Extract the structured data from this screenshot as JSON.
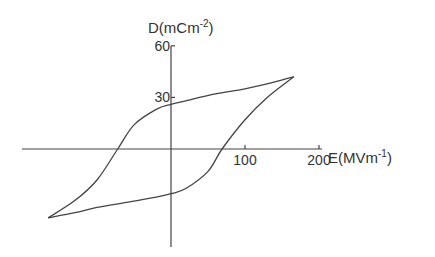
{
  "chart_data": {
    "type": "line",
    "title": "",
    "xlabel": "E(MVm-1)",
    "ylabel": "D(mCm-2)",
    "xlabel_parts": {
      "base": "E(MVm",
      "sup": "-1",
      "close": ")"
    },
    "ylabel_parts": {
      "base": "D(mCm",
      "sup": "-2",
      "close": ")"
    },
    "x_ticks": [
      100,
      200
    ],
    "x_tick_labels": [
      "100",
      "200"
    ],
    "y_ticks": [
      30,
      60
    ],
    "y_tick_labels": [
      "30",
      "60"
    ],
    "xlim": [
      -200,
      200
    ],
    "ylim": [
      -60,
      60
    ],
    "grid": false,
    "legend": null,
    "series": [
      {
        "name": "upper branch (decreasing E)",
        "x": [
          166,
          140,
          100,
          60,
          20,
          0,
          -20,
          -50,
          -72,
          -100,
          -130,
          -166
        ],
        "y": [
          42,
          39,
          35,
          32,
          28,
          26,
          23,
          14,
          0,
          -18,
          -30,
          -40
        ]
      },
      {
        "name": "lower branch (increasing E)",
        "x": [
          -166,
          -130,
          -100,
          -60,
          -20,
          0,
          20,
          50,
          69,
          100,
          130,
          166
        ],
        "y": [
          -40,
          -37,
          -34,
          -31,
          -28,
          -26,
          -23,
          -13,
          0,
          17,
          30,
          42
        ]
      }
    ],
    "annotations": {
      "coercive_field": 70,
      "remanent_polarization": 26,
      "saturation_point": [
        166,
        42
      ]
    }
  }
}
